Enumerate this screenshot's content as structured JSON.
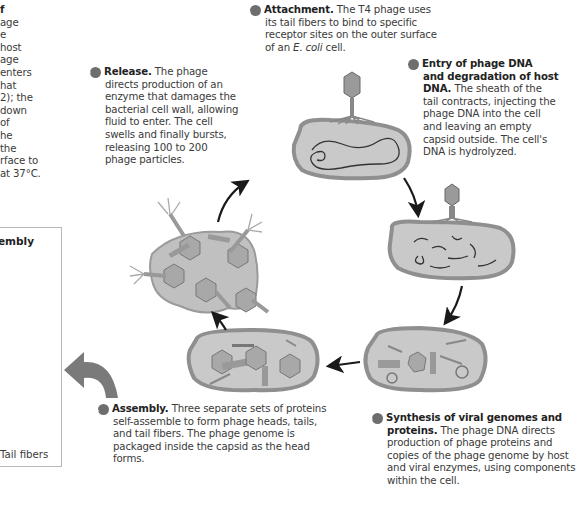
{
  "intro": {
    "lines": [
      "f",
      "age",
      "e",
      "host",
      "age",
      "enters",
      "hat",
      "2); the",
      "down",
      "of",
      "he",
      "the",
      "rface to",
      "at 37°C."
    ]
  },
  "panel": {
    "title": "embly",
    "caption": "Tail fibers"
  },
  "steps": [
    {
      "num": "1",
      "title": "Attachment.",
      "lines": [
        "The T4 phage uses",
        "its tail fibers to bind to specific",
        "receptor sites on the outer surface"
      ],
      "last_pre": "of an ",
      "last_em": "E. coli",
      "last_post": " cell."
    },
    {
      "num": "2",
      "title_lines": [
        "Entry of phage DNA",
        "and degradation of host",
        "DNA."
      ],
      "lines": [
        "The sheath of the",
        "tail contracts, injecting the",
        "phage DNA into the cell",
        "and leaving an empty",
        "capsid outside. The cell's",
        "DNA is hydrolyzed."
      ]
    },
    {
      "num": "3",
      "title_lines": [
        "Synthesis of viral genomes and",
        "proteins."
      ],
      "lines": [
        "The phage DNA directs",
        "production of phage proteins and",
        "copies of the phage genome by host",
        "and viral enzymes, using components",
        "within the cell."
      ]
    },
    {
      "num": "4",
      "title": "Assembly.",
      "lines": [
        "Three separate sets of proteins",
        "self-assemble to form phage heads, tails,",
        "and tail fibers. The phage genome is",
        "packaged inside the capsid as the head",
        "forms."
      ]
    },
    {
      "num": "5",
      "title": "Release.",
      "lines": [
        "The phage",
        "directs production of an",
        "enzyme that damages the",
        "bacterial cell wall, allowing",
        "fluid to enter. The cell",
        "swells and finally bursts,",
        "releasing 100 to 200",
        "phage particles."
      ]
    }
  ],
  "colors": {
    "cell_wall": "#8f8f8f",
    "cell_fill": "#c9c9c9",
    "cell_inner": "#d8d8d8",
    "phage": "#9a9a9a",
    "arrow": "#1a1a1a",
    "big_arrow": "#7a7a7a",
    "badge": "#6e6e6e"
  }
}
